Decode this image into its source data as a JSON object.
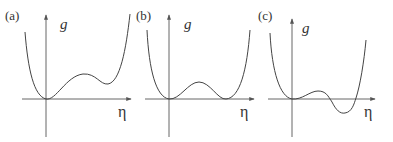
{
  "figure": {
    "panels": [
      {
        "id": "a",
        "label": "(a)",
        "y_axis_label": "g",
        "x_axis_label": "η",
        "description": "global minimum at η=0, local maximum, then metastable local minimum above zero"
      },
      {
        "id": "b",
        "label": "(b)",
        "y_axis_label": "g",
        "x_axis_label": "η",
        "description": "two degenerate minima at g=0 separated by a barrier"
      },
      {
        "id": "c",
        "label": "(c)",
        "y_axis_label": "g",
        "x_axis_label": "η",
        "description": "minimum at η=0 becomes metastable; deeper minimum below zero at finite η"
      }
    ],
    "colors": {
      "axis": "#555555",
      "curve": "#444444",
      "text": "#333333",
      "background": "#ffffff"
    }
  }
}
